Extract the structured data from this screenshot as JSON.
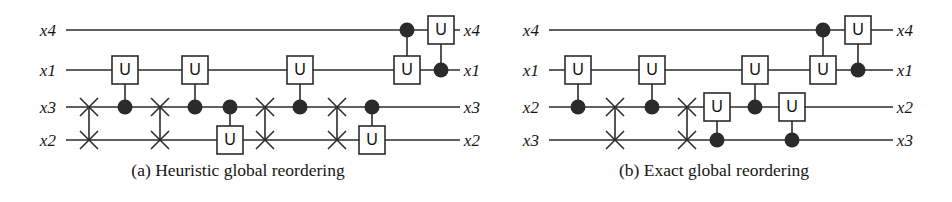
{
  "figure": {
    "width": 952,
    "height": 202,
    "background": "#ffffff",
    "ink_color": "#2b2b2b",
    "text_color": "#141414"
  },
  "panels": [
    {
      "id": "a",
      "caption": "(a) Heuristic global reordering",
      "input_labels": [
        "x4",
        "x1",
        "x3",
        "x2"
      ],
      "output_labels": [
        "x4",
        "x1",
        "x3",
        "x2"
      ],
      "label_x_left": 48,
      "label_x_right": 472,
      "wire_x_start": 66,
      "wire_x_end": 460,
      "wire_y": [
        30,
        70,
        107,
        140
      ],
      "gate_u_label": "U",
      "elements": [
        {
          "kind": "swap",
          "x": 89,
          "wires": [
            2,
            3
          ]
        },
        {
          "kind": "cu",
          "x": 125,
          "control_wire": 2,
          "target_wire": 1
        },
        {
          "kind": "swap",
          "x": 160,
          "wires": [
            2,
            3
          ]
        },
        {
          "kind": "cu",
          "x": 195,
          "control_wire": 2,
          "target_wire": 1
        },
        {
          "kind": "cu",
          "x": 230,
          "control_wire": 2,
          "target_wire": 3
        },
        {
          "kind": "swap",
          "x": 265,
          "wires": [
            2,
            3
          ]
        },
        {
          "kind": "cu",
          "x": 300,
          "control_wire": 2,
          "target_wire": 1
        },
        {
          "kind": "swap",
          "x": 337,
          "wires": [
            2,
            3
          ]
        },
        {
          "kind": "cu",
          "x": 372,
          "control_wire": 2,
          "target_wire": 3
        },
        {
          "kind": "cu",
          "x": 407,
          "control_wire": 0,
          "target_wire": 1
        },
        {
          "kind": "cu",
          "x": 441,
          "control_wire": 1,
          "target_wire": 0
        }
      ]
    },
    {
      "id": "b",
      "caption": "(b) Exact global reordering",
      "input_labels": [
        "x4",
        "x1",
        "x2",
        "x3"
      ],
      "output_labels": [
        "x4",
        "x1",
        "x2",
        "x3"
      ],
      "label_x_left": 55,
      "label_x_right": 429,
      "wire_x_start": 73,
      "wire_x_end": 417,
      "wire_y": [
        30,
        70,
        107,
        140
      ],
      "gate_u_label": "U",
      "elements": [
        {
          "kind": "cu",
          "x": 102,
          "control_wire": 2,
          "target_wire": 1
        },
        {
          "kind": "swap",
          "x": 139,
          "wires": [
            2,
            3
          ]
        },
        {
          "kind": "cu",
          "x": 176,
          "control_wire": 2,
          "target_wire": 1
        },
        {
          "kind": "swap",
          "x": 211,
          "wires": [
            2,
            3
          ]
        },
        {
          "kind": "cu",
          "x": 241,
          "control_wire": 3,
          "target_wire": 2
        },
        {
          "kind": "cu",
          "x": 279,
          "control_wire": 2,
          "target_wire": 1
        },
        {
          "kind": "cu",
          "x": 316,
          "control_wire": 3,
          "target_wire": 2
        },
        {
          "kind": "cu",
          "x": 347,
          "control_wire": 0,
          "target_wire": 1
        },
        {
          "kind": "cu",
          "x": 382,
          "control_wire": 1,
          "target_wire": 0
        }
      ]
    }
  ],
  "geometry": {
    "gate_box_width": 26,
    "gate_box_height": 28,
    "control_dot_radius": 7.5,
    "swap_arm": 9,
    "line_width": 1.6
  }
}
